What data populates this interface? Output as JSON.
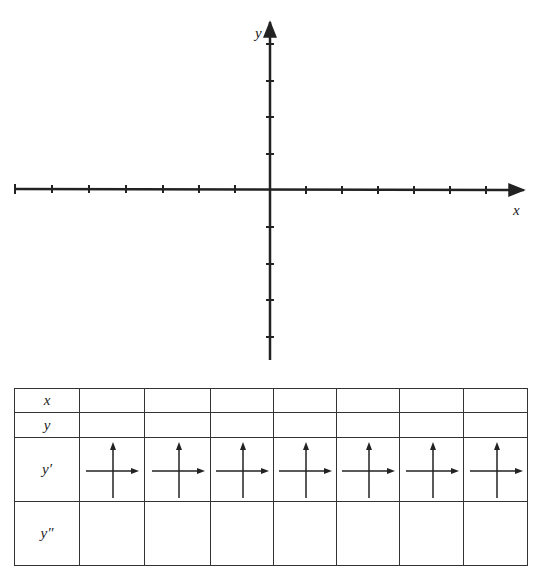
{
  "graph": {
    "x_axis_label": "x",
    "y_axis_label": "y",
    "x_ticks_left": 7,
    "x_ticks_right": 6,
    "y_ticks_up": 4,
    "y_ticks_down": 4
  },
  "table": {
    "row_labels": [
      "x",
      "y",
      "y′",
      "y″"
    ],
    "columns": 7,
    "rows": [
      {
        "name": "x",
        "cells": [
          "",
          "",
          "",
          "",
          "",
          "",
          ""
        ]
      },
      {
        "name": "y",
        "cells": [
          "",
          "",
          "",
          "",
          "",
          "",
          ""
        ]
      },
      {
        "name": "y-prime",
        "cells": [
          "arrow-cross",
          "arrow-cross",
          "arrow-cross",
          "arrow-cross",
          "arrow-cross",
          "arrow-cross",
          "arrow-cross"
        ]
      },
      {
        "name": "y-double-prime",
        "cells": [
          "",
          "",
          "",
          "",
          "",
          "",
          ""
        ]
      }
    ]
  },
  "colors": {
    "ink": "#222222",
    "background": "#ffffff"
  }
}
